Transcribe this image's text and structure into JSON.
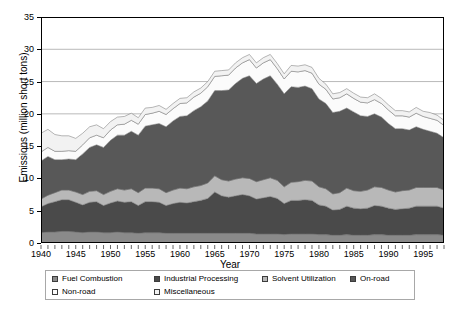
{
  "chart_data": {
    "type": "area",
    "stacked": true,
    "title": "",
    "xlabel": "Year",
    "ylabel": "Emissions (million short tons)",
    "xlim": [
      1940,
      1998
    ],
    "ylim": [
      0,
      35
    ],
    "ytick_step": 5,
    "xtick_step": 5,
    "grid": true,
    "grid_axis": "y",
    "legend_position": "bottom",
    "xticks": [
      "1940",
      "1945",
      "1950",
      "1955",
      "1960",
      "1965",
      "1970",
      "1975",
      "1980",
      "1985",
      "1990",
      "1995"
    ],
    "yticks": [
      "0",
      "5",
      "10",
      "15",
      "20",
      "25",
      "30",
      "35"
    ],
    "x": [
      1940,
      1941,
      1942,
      1943,
      1944,
      1945,
      1946,
      1947,
      1948,
      1949,
      1950,
      1951,
      1952,
      1953,
      1954,
      1955,
      1956,
      1957,
      1958,
      1959,
      1960,
      1961,
      1962,
      1963,
      1964,
      1965,
      1966,
      1967,
      1968,
      1969,
      1970,
      1971,
      1972,
      1973,
      1974,
      1975,
      1976,
      1977,
      1978,
      1979,
      1980,
      1981,
      1982,
      1983,
      1984,
      1985,
      1986,
      1987,
      1988,
      1989,
      1990,
      1991,
      1992,
      1993,
      1994,
      1995,
      1996,
      1997,
      1998
    ],
    "series": [
      {
        "name": "Fuel Combustion",
        "color": "#8a8a8a",
        "values": [
          1.6,
          1.7,
          1.7,
          1.8,
          1.8,
          1.7,
          1.6,
          1.7,
          1.7,
          1.6,
          1.6,
          1.7,
          1.6,
          1.6,
          1.5,
          1.6,
          1.6,
          1.6,
          1.5,
          1.5,
          1.5,
          1.5,
          1.5,
          1.5,
          1.5,
          1.5,
          1.5,
          1.5,
          1.5,
          1.5,
          1.5,
          1.4,
          1.4,
          1.4,
          1.4,
          1.3,
          1.4,
          1.4,
          1.4,
          1.4,
          1.3,
          1.3,
          1.2,
          1.2,
          1.3,
          1.2,
          1.2,
          1.2,
          1.3,
          1.3,
          1.2,
          1.2,
          1.2,
          1.2,
          1.3,
          1.3,
          1.3,
          1.3,
          1.2
        ]
      },
      {
        "name": "Industrial Processing",
        "color": "#4a4a4a",
        "values": [
          4.0,
          4.4,
          4.7,
          4.9,
          4.9,
          4.6,
          4.3,
          4.6,
          4.7,
          4.2,
          4.6,
          4.8,
          4.7,
          4.8,
          4.3,
          4.8,
          4.8,
          4.7,
          4.3,
          4.6,
          4.8,
          4.7,
          4.9,
          5.1,
          5.4,
          6.4,
          5.8,
          5.6,
          5.8,
          6.0,
          5.8,
          5.4,
          5.6,
          5.8,
          5.5,
          4.8,
          5.2,
          5.2,
          5.3,
          5.2,
          4.6,
          4.4,
          3.9,
          4.0,
          4.4,
          4.2,
          4.1,
          4.2,
          4.5,
          4.4,
          4.2,
          4.0,
          4.1,
          4.2,
          4.4,
          4.4,
          4.4,
          4.4,
          4.2
        ]
      },
      {
        "name": "Solvent Utilization",
        "color": "#b8b8b8",
        "values": [
          1.2,
          1.3,
          1.4,
          1.5,
          1.5,
          1.6,
          1.6,
          1.7,
          1.7,
          1.7,
          1.8,
          1.9,
          1.9,
          2.0,
          2.0,
          2.1,
          2.1,
          2.1,
          2.0,
          2.1,
          2.2,
          2.2,
          2.3,
          2.3,
          2.4,
          2.5,
          2.5,
          2.5,
          2.6,
          2.6,
          2.7,
          2.7,
          2.8,
          2.9,
          2.8,
          2.6,
          2.8,
          2.9,
          3.0,
          3.0,
          2.8,
          2.7,
          2.5,
          2.6,
          2.8,
          2.7,
          2.7,
          2.8,
          2.9,
          2.9,
          2.8,
          2.7,
          2.8,
          2.8,
          2.9,
          2.9,
          2.9,
          2.9,
          2.8
        ]
      },
      {
        "name": "On-road",
        "color": "#585858",
        "values": [
          5.9,
          6.0,
          5.1,
          4.7,
          4.8,
          5.0,
          6.3,
          6.8,
          7.1,
          7.3,
          7.9,
          8.3,
          8.5,
          8.9,
          8.9,
          9.6,
          9.8,
          10.1,
          10.2,
          10.7,
          11.1,
          11.3,
          11.8,
          12.2,
          12.7,
          13.2,
          13.8,
          14.1,
          14.8,
          15.4,
          15.9,
          15.2,
          15.6,
          15.8,
          14.9,
          14.4,
          14.8,
          14.6,
          14.6,
          14.3,
          13.6,
          13.2,
          12.6,
          12.6,
          12.4,
          12.2,
          11.7,
          11.4,
          11.3,
          10.9,
          10.3,
          9.8,
          9.6,
          9.3,
          9.4,
          9.0,
          8.7,
          8.4,
          8.1
        ]
      },
      {
        "name": "Non-road",
        "color": "#fbfbfb",
        "values": [
          1.4,
          1.4,
          1.3,
          1.3,
          1.3,
          1.3,
          1.4,
          1.5,
          1.5,
          1.5,
          1.6,
          1.6,
          1.7,
          1.7,
          1.7,
          1.8,
          1.8,
          1.9,
          1.9,
          1.9,
          2.0,
          2.0,
          2.1,
          2.1,
          2.2,
          2.2,
          2.3,
          2.3,
          2.4,
          2.4,
          2.5,
          2.4,
          2.5,
          2.5,
          2.4,
          2.3,
          2.4,
          2.4,
          2.4,
          2.4,
          2.3,
          2.2,
          2.1,
          2.1,
          2.2,
          2.1,
          2.1,
          2.1,
          2.2,
          2.1,
          2.1,
          2.0,
          2.0,
          2.0,
          2.1,
          2.0,
          2.0,
          2.0,
          1.9
        ]
      },
      {
        "name": "Miscellaneous",
        "color": "#f2f2f2",
        "values": [
          2.9,
          2.8,
          2.6,
          2.4,
          2.3,
          2.0,
          1.8,
          1.7,
          1.6,
          1.4,
          1.3,
          1.2,
          1.2,
          1.1,
          1.0,
          1.0,
          0.9,
          0.9,
          0.8,
          0.8,
          0.8,
          0.8,
          0.8,
          0.8,
          0.8,
          0.8,
          0.8,
          0.8,
          0.8,
          0.8,
          0.8,
          0.8,
          0.8,
          0.8,
          0.8,
          0.8,
          0.9,
          0.9,
          0.9,
          0.9,
          0.9,
          0.8,
          0.8,
          0.8,
          0.8,
          0.8,
          0.8,
          0.8,
          0.9,
          0.8,
          0.8,
          0.8,
          0.8,
          0.8,
          0.9,
          0.8,
          0.9,
          0.8,
          0.8
        ]
      }
    ],
    "totals": [
      17.0,
      17.6,
      16.8,
      16.6,
      16.6,
      16.2,
      17.0,
      18.0,
      18.3,
      17.7,
      18.8,
      19.5,
      19.6,
      20.1,
      19.4,
      20.9,
      21.0,
      21.3,
      20.7,
      21.6,
      22.4,
      22.5,
      23.4,
      24.0,
      25.0,
      26.6,
      26.7,
      26.8,
      27.9,
      28.7,
      29.2,
      27.9,
      28.7,
      29.2,
      27.8,
      26.2,
      27.5,
      27.4,
      27.6,
      27.2,
      25.5,
      24.6,
      23.1,
      23.3,
      23.9,
      23.2,
      22.6,
      22.5,
      23.1,
      22.4,
      21.4,
      20.5,
      20.5,
      20.3,
      21.0,
      20.4,
      20.2,
      19.8,
      19.0
    ]
  },
  "axis": {
    "ylabel": "Emissions (million short tons)",
    "xlabel": "Year"
  },
  "legend": {
    "items": [
      {
        "label": "Fuel Combustion",
        "color": "#8a8a8a"
      },
      {
        "label": "Industrial Processing",
        "color": "#4a4a4a"
      },
      {
        "label": "Solvent Utilization",
        "color": "#b8b8b8"
      },
      {
        "label": "On-road",
        "color": "#585858"
      },
      {
        "label": "Non-road",
        "color": "#fbfbfb"
      },
      {
        "label": "Miscellaneous",
        "color": "#f2f2f2"
      }
    ]
  }
}
